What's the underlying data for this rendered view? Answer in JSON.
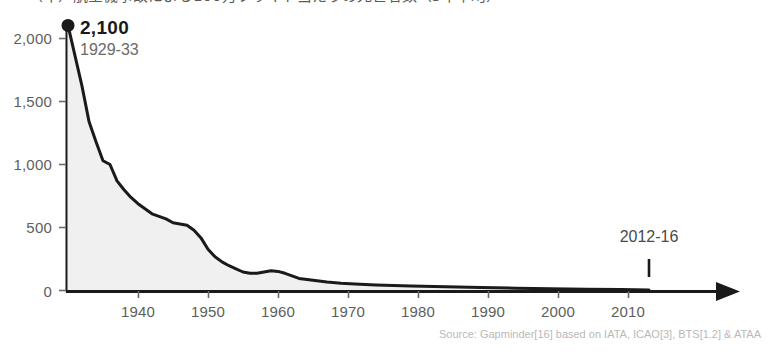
{
  "title": "（年）航空機事故による100万フライト当たりの死亡者数（5年平均）",
  "chart_data": {
    "type": "area",
    "title": "",
    "xlabel": "",
    "ylabel": "",
    "xlim": [
      1931,
      2014
    ],
    "ylim": [
      0,
      2200
    ],
    "grid": false,
    "legend_position": "none",
    "xticks": [
      "1940",
      "1950",
      "1960",
      "1970",
      "1980",
      "1990",
      "2000",
      "2010"
    ],
    "xtick_values": [
      1940,
      1950,
      1960,
      1970,
      1980,
      1990,
      2000,
      2010
    ],
    "yticks": [
      "0",
      "500",
      "1,000",
      "1,500",
      "2,000"
    ],
    "ytick_values": [
      0,
      500,
      1000,
      1500,
      2000
    ],
    "x": [
      1931,
      1933,
      1934,
      1935,
      1936,
      1937,
      1938,
      1939,
      1940,
      1941,
      1942,
      1943,
      1944,
      1945,
      1946,
      1947,
      1948,
      1949,
      1950,
      1951,
      1952,
      1953,
      1954,
      1955,
      1956,
      1957,
      1958,
      1959,
      1960,
      1961,
      1962,
      1963,
      1964,
      1966,
      1968,
      1970,
      1972,
      1975,
      1980,
      1985,
      1990,
      1995,
      2000,
      2005,
      2010,
      2014
    ],
    "values": [
      2100,
      1620,
      1340,
      1180,
      1030,
      1000,
      870,
      800,
      740,
      690,
      650,
      610,
      590,
      570,
      540,
      530,
      520,
      480,
      420,
      330,
      270,
      230,
      200,
      175,
      150,
      140,
      140,
      150,
      160,
      155,
      140,
      120,
      100,
      85,
      72,
      62,
      55,
      48,
      40,
      33,
      27,
      22,
      18,
      14,
      11,
      9
    ],
    "annotations": [
      {
        "name": "peak",
        "label": "2,100",
        "sublabel": "1929-33",
        "x": 1931,
        "y": 2100,
        "marker": "dot"
      },
      {
        "name": "end-period",
        "label": "2012-16",
        "x": 2014,
        "y": 0,
        "marker": "tick"
      }
    ],
    "series_fill_color": "#f0f0f0",
    "series_line_color": "#1a1a1a",
    "axis_color": "#1a1a1a",
    "tick_label_color": "#5e5e5e"
  },
  "source": {
    "text": "Source: Gapminder[16] based on IATA, ICAO[3], BTS[1.2] & ATAA"
  }
}
